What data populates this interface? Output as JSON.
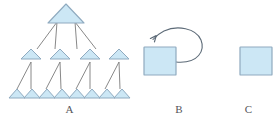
{
  "figure": {
    "background_color": "#ffffff",
    "width": 278,
    "height": 126,
    "shape_fill": "#cce7f5",
    "shape_stroke": "#8faabf",
    "connector_color": "#7b7b7b",
    "arrow_color": "#5d6b78",
    "label_color": "#55565a"
  },
  "panels": [
    {
      "id": "a",
      "label": "A",
      "type": "hierarchy-tree",
      "description": "Hierarchical tree of triangles, one root branching into four, branching into eight",
      "levels": [
        {
          "level": 1,
          "count": 1,
          "shape": "triangle",
          "size": "large"
        },
        {
          "level": 2,
          "count": 4,
          "shape": "triangle",
          "size": "medium"
        },
        {
          "level": 3,
          "count": 8,
          "shape": "triangle",
          "size": "small"
        }
      ],
      "branching_factor": 2,
      "node_count": 13
    },
    {
      "id": "b",
      "label": "B",
      "type": "self-loop",
      "description": "A single square with a curved arrow looping from its right side back to itself",
      "shape": "square",
      "shape_count": 1,
      "has_loop_arrow": true,
      "arrow_direction": "counterclockwise"
    },
    {
      "id": "c",
      "label": "C",
      "type": "single-element",
      "description": "A single isolated square with no connections",
      "shape": "square",
      "shape_count": 1,
      "has_loop_arrow": false
    }
  ]
}
